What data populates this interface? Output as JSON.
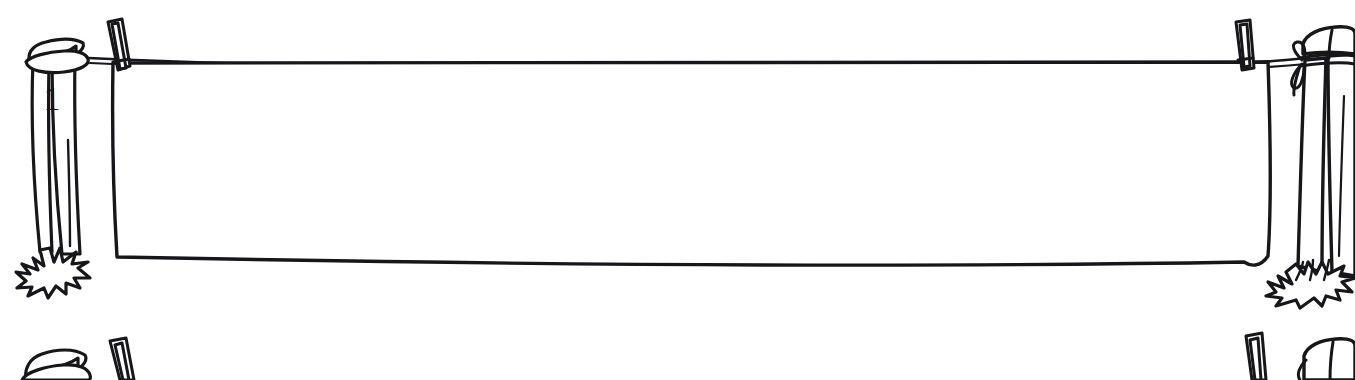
{
  "illustration": {
    "title": "Blank clothesline worksheet",
    "style": "hand-drawn black ink line art on white",
    "background_color": "#ffffff",
    "ink_color": "#17161a",
    "canvas": {
      "width": 1355,
      "height": 380
    }
  },
  "rows": [
    {
      "index": 1,
      "name": "clothesline-row-1",
      "label": "1",
      "left_post": {
        "name": "wooden-post-left",
        "label": "1",
        "has_grass_tuft": true,
        "rope_attachment": "wrapped-band"
      },
      "right_post": {
        "name": "wooden-post-right",
        "label": "",
        "has_grass_tuft": true,
        "rope_attachment": "tied-knot-with-loose-ends"
      },
      "clothespins": [
        {
          "name": "clothespin-left",
          "position": "left"
        },
        {
          "name": "clothespin-right",
          "position": "right"
        }
      ],
      "hanging_sheet": {
        "name": "blank-hanging-sheet",
        "content": "",
        "fill_color": "#ffffff"
      },
      "line": {
        "name": "clothesline-rope",
        "sag": "slight"
      }
    },
    {
      "index": 2,
      "name": "clothesline-row-2",
      "label": "2",
      "left_post": {
        "name": "wooden-post-left",
        "label": "",
        "has_grass_tuft": false,
        "rope_attachment": "wrapped-band"
      },
      "right_post": {
        "name": "wooden-post-right",
        "label": "",
        "has_grass_tuft": false,
        "rope_attachment": "wrapped-band"
      },
      "clothespins": [
        {
          "name": "clothespin-left",
          "position": "left"
        },
        {
          "name": "clothespin-right",
          "position": "right"
        }
      ],
      "hanging_sheet": null,
      "line": {
        "name": "clothesline-rope",
        "sag": "slight"
      }
    }
  ]
}
